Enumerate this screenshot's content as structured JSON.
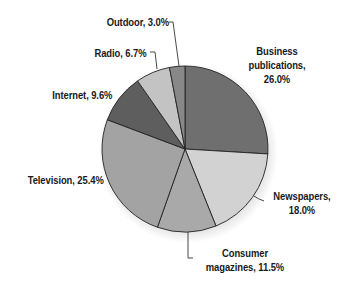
{
  "chart_data": {
    "type": "pie",
    "title": "",
    "categories": [
      "Business publications",
      "Newspapers",
      "Consumer magazines",
      "Television",
      "Internet",
      "Radio",
      "Outdoor"
    ],
    "values": [
      26.0,
      18.0,
      11.5,
      25.4,
      9.6,
      6.7,
      3.0
    ],
    "unit": "%",
    "colors": [
      "#6f6f6f",
      "#d2d2d2",
      "#a9a9a9",
      "#a3a3a3",
      "#5e5e5e",
      "#c3c3c3",
      "#888888"
    ],
    "start_angle_deg": 0,
    "direction": "clockwise",
    "legend": "none (direct labels with leader lines)",
    "labels": [
      {
        "lines": [
          "Business",
          "publications,",
          "26.0%"
        ]
      },
      {
        "lines": [
          "Newspapers,",
          "18.0%"
        ]
      },
      {
        "lines": [
          "Consumer",
          "magazines, 11.5%"
        ]
      },
      {
        "lines": [
          "Television, 25.4%"
        ]
      },
      {
        "lines": [
          "Internet, 9.6%"
        ]
      },
      {
        "lines": [
          "Radio, 6.7%"
        ]
      },
      {
        "lines": [
          "Outdoor, 3.0%"
        ]
      }
    ]
  }
}
